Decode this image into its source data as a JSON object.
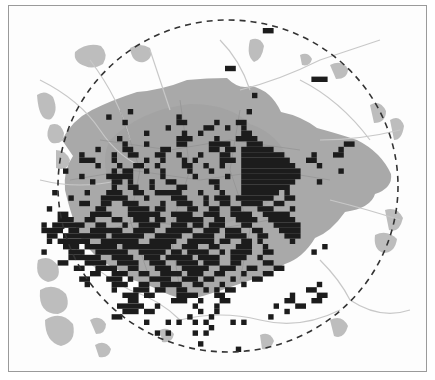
{
  "map": {
    "type": "grid-density-map",
    "colors": {
      "background": "#fdfdfd",
      "frame": "#9a9a9a",
      "urban_core": "#a9a9a9",
      "outer_patches": "#bdbdbd",
      "roads": "#c8c8c8",
      "boundaries": "#8f8f8f",
      "cells": "#1c1c1c",
      "circle": "#333333"
    },
    "circle": {
      "cx": 228,
      "cy": 186,
      "rx": 170,
      "ry": 166,
      "style": "dashed"
    },
    "grid": {
      "x0": 36,
      "y0": 28,
      "cell": 5.4
    },
    "cell_rows": [
      {
        "r": 0,
        "segs": [
          [
            42,
            43
          ]
        ]
      },
      {
        "r": 7,
        "segs": [
          [
            35,
            36
          ]
        ]
      },
      {
        "r": 9,
        "segs": [
          [
            51,
            53
          ]
        ]
      },
      {
        "r": 12,
        "segs": [
          [
            40,
            40
          ]
        ]
      },
      {
        "r": 15,
        "segs": [
          [
            17,
            17
          ],
          [
            39,
            39
          ]
        ]
      },
      {
        "r": 16,
        "segs": [
          [
            13,
            13
          ],
          [
            26,
            26
          ]
        ]
      },
      {
        "r": 17,
        "segs": [
          [
            16,
            16
          ],
          [
            26,
            27
          ],
          [
            33,
            33
          ],
          [
            37,
            38
          ]
        ]
      },
      {
        "r": 18,
        "segs": [
          [
            24,
            24
          ],
          [
            31,
            32
          ],
          [
            35,
            35
          ],
          [
            38,
            38
          ]
        ]
      },
      {
        "r": 19,
        "segs": [
          [
            20,
            20
          ],
          [
            27,
            27
          ],
          [
            30,
            30
          ],
          [
            38,
            39
          ]
        ]
      },
      {
        "r": 20,
        "segs": [
          [
            15,
            15
          ],
          [
            26,
            28
          ],
          [
            33,
            33
          ],
          [
            37,
            40
          ]
        ]
      },
      {
        "r": 21,
        "segs": [
          [
            16,
            16
          ],
          [
            20,
            20
          ],
          [
            26,
            27
          ],
          [
            32,
            35
          ],
          [
            39,
            41
          ],
          [
            57,
            58
          ]
        ]
      },
      {
        "r": 22,
        "segs": [
          [
            11,
            11
          ],
          [
            16,
            17
          ],
          [
            23,
            24
          ],
          [
            32,
            33
          ],
          [
            35,
            36
          ],
          [
            38,
            43
          ],
          [
            56,
            56
          ]
        ]
      },
      {
        "r": 23,
        "segs": [
          [
            8,
            8
          ],
          [
            14,
            14
          ],
          [
            17,
            18
          ],
          [
            22,
            23
          ],
          [
            26,
            26
          ],
          [
            30,
            30
          ],
          [
            34,
            35
          ],
          [
            38,
            45
          ],
          [
            51,
            51
          ],
          [
            55,
            56
          ]
        ]
      },
      {
        "r": 24,
        "segs": [
          [
            8,
            10
          ],
          [
            14,
            14
          ],
          [
            20,
            20
          ],
          [
            23,
            23
          ],
          [
            27,
            27
          ],
          [
            29,
            29
          ],
          [
            34,
            36
          ],
          [
            38,
            46
          ],
          [
            50,
            51
          ]
        ]
      },
      {
        "r": 25,
        "segs": [
          [
            11,
            11
          ],
          [
            15,
            15
          ],
          [
            18,
            19
          ],
          [
            22,
            22
          ],
          [
            27,
            28
          ],
          [
            31,
            31
          ],
          [
            34,
            34
          ],
          [
            38,
            47
          ],
          [
            52,
            52
          ]
        ]
      },
      {
        "r": 26,
        "segs": [
          [
            5,
            5
          ],
          [
            14,
            14
          ],
          [
            16,
            17
          ],
          [
            20,
            20
          ],
          [
            23,
            23
          ],
          [
            28,
            28
          ],
          [
            32,
            32
          ],
          [
            38,
            48
          ],
          [
            56,
            56
          ]
        ]
      },
      {
        "r": 27,
        "segs": [
          [
            8,
            8
          ],
          [
            13,
            17
          ],
          [
            23,
            23
          ],
          [
            29,
            29
          ],
          [
            35,
            35
          ],
          [
            38,
            48
          ]
        ]
      },
      {
        "r": 28,
        "segs": [
          [
            10,
            10
          ],
          [
            14,
            15
          ],
          [
            17,
            17
          ],
          [
            21,
            21
          ],
          [
            24,
            25
          ],
          [
            32,
            33
          ],
          [
            38,
            47
          ],
          [
            52,
            52
          ]
        ]
      },
      {
        "r": 29,
        "segs": [
          [
            14,
            14
          ],
          [
            17,
            18
          ],
          [
            21,
            21
          ],
          [
            26,
            27
          ],
          [
            33,
            33
          ],
          [
            38,
            46
          ]
        ]
      },
      {
        "r": 30,
        "segs": [
          [
            3,
            3
          ],
          [
            9,
            9
          ],
          [
            13,
            15
          ],
          [
            18,
            19
          ],
          [
            22,
            26
          ],
          [
            30,
            30
          ],
          [
            34,
            34
          ],
          [
            38,
            44
          ],
          [
            46,
            46
          ]
        ]
      },
      {
        "r": 31,
        "segs": [
          [
            6,
            6
          ],
          [
            12,
            16
          ],
          [
            20,
            20
          ],
          [
            25,
            27
          ],
          [
            31,
            31
          ],
          [
            33,
            35
          ],
          [
            37,
            43
          ],
          [
            46,
            47
          ]
        ]
      },
      {
        "r": 32,
        "segs": [
          [
            8,
            9
          ],
          [
            12,
            13
          ],
          [
            16,
            18
          ],
          [
            23,
            23
          ],
          [
            26,
            28
          ],
          [
            31,
            31
          ],
          [
            34,
            35
          ],
          [
            38,
            41
          ],
          [
            44,
            45
          ]
        ]
      },
      {
        "r": 33,
        "segs": [
          [
            2,
            2
          ],
          [
            11,
            12
          ],
          [
            17,
            20
          ],
          [
            22,
            23
          ],
          [
            28,
            29
          ],
          [
            32,
            33
          ],
          [
            36,
            37
          ],
          [
            41,
            43
          ],
          [
            47,
            47
          ]
        ]
      },
      {
        "r": 34,
        "segs": [
          [
            4,
            5
          ],
          [
            10,
            13
          ],
          [
            17,
            22
          ],
          [
            25,
            28
          ],
          [
            31,
            33
          ],
          [
            36,
            39
          ],
          [
            42,
            46
          ]
        ]
      },
      {
        "r": 35,
        "segs": [
          [
            4,
            6
          ],
          [
            9,
            10
          ],
          [
            14,
            15
          ],
          [
            18,
            20
          ],
          [
            22,
            23
          ],
          [
            26,
            30
          ],
          [
            33,
            34
          ],
          [
            37,
            40
          ],
          [
            43,
            47
          ]
        ]
      },
      {
        "r": 36,
        "segs": [
          [
            1,
            1
          ],
          [
            3,
            8
          ],
          [
            11,
            12
          ],
          [
            16,
            16
          ],
          [
            19,
            22
          ],
          [
            25,
            27
          ],
          [
            29,
            30
          ],
          [
            32,
            34
          ],
          [
            38,
            39
          ],
          [
            44,
            48
          ]
        ]
      },
      {
        "r": 37,
        "segs": [
          [
            1,
            4
          ],
          [
            6,
            7
          ],
          [
            10,
            15
          ],
          [
            18,
            21
          ],
          [
            24,
            28
          ],
          [
            31,
            33
          ],
          [
            35,
            37
          ],
          [
            40,
            41
          ],
          [
            45,
            48
          ]
        ]
      },
      {
        "r": 38,
        "segs": [
          [
            2,
            3
          ],
          [
            5,
            12
          ],
          [
            14,
            19
          ],
          [
            22,
            26
          ],
          [
            29,
            32
          ],
          [
            35,
            38
          ],
          [
            41,
            42
          ],
          [
            46,
            48
          ]
        ]
      },
      {
        "r": 39,
        "segs": [
          [
            2,
            2
          ],
          [
            4,
            9
          ],
          [
            12,
            18
          ],
          [
            21,
            25
          ],
          [
            28,
            32
          ],
          [
            34,
            35
          ],
          [
            38,
            39
          ],
          [
            41,
            41
          ],
          [
            47,
            47
          ]
        ]
      },
      {
        "r": 40,
        "segs": [
          [
            5,
            7
          ],
          [
            9,
            14
          ],
          [
            16,
            24
          ],
          [
            27,
            29
          ],
          [
            32,
            33
          ],
          [
            37,
            39
          ],
          [
            42,
            42
          ],
          [
            53,
            53
          ]
        ]
      },
      {
        "r": 41,
        "segs": [
          [
            1,
            1
          ],
          [
            6,
            8
          ],
          [
            11,
            16
          ],
          [
            19,
            23
          ],
          [
            25,
            26
          ],
          [
            28,
            31
          ],
          [
            34,
            34
          ],
          [
            36,
            39
          ],
          [
            42,
            43
          ],
          [
            51,
            51
          ]
        ]
      },
      {
        "r": 42,
        "segs": [
          [
            6,
            11
          ],
          [
            14,
            17
          ],
          [
            20,
            22
          ],
          [
            24,
            28
          ],
          [
            30,
            33
          ],
          [
            36,
            38
          ],
          [
            41,
            41
          ]
        ]
      },
      {
        "r": 43,
        "segs": [
          [
            4,
            5
          ],
          [
            9,
            12
          ],
          [
            15,
            18
          ],
          [
            21,
            23
          ],
          [
            26,
            29
          ],
          [
            31,
            33
          ],
          [
            36,
            37
          ],
          [
            42,
            43
          ]
        ]
      },
      {
        "r": 44,
        "segs": [
          [
            7,
            8
          ],
          [
            11,
            14
          ],
          [
            17,
            18
          ],
          [
            22,
            24
          ],
          [
            27,
            31
          ],
          [
            34,
            36
          ],
          [
            39,
            40
          ],
          [
            44,
            45
          ]
        ]
      },
      {
        "r": 45,
        "segs": [
          [
            10,
            11
          ],
          [
            14,
            16
          ],
          [
            19,
            20
          ],
          [
            23,
            26
          ],
          [
            28,
            30
          ],
          [
            33,
            34
          ],
          [
            38,
            38
          ],
          [
            42,
            43
          ]
        ]
      },
      {
        "r": 46,
        "segs": [
          [
            8,
            9
          ],
          [
            13,
            15
          ],
          [
            17,
            17
          ],
          [
            21,
            24
          ],
          [
            27,
            29
          ],
          [
            31,
            32
          ],
          [
            36,
            36
          ],
          [
            40,
            41
          ]
        ]
      },
      {
        "r": 47,
        "segs": [
          [
            9,
            9
          ],
          [
            14,
            16
          ],
          [
            19,
            20
          ],
          [
            23,
            26
          ],
          [
            29,
            30
          ],
          [
            34,
            34
          ],
          [
            38,
            38
          ],
          [
            52,
            52
          ]
        ]
      },
      {
        "r": 48,
        "segs": [
          [
            14,
            14
          ],
          [
            18,
            20
          ],
          [
            22,
            23
          ],
          [
            26,
            27
          ],
          [
            31,
            31
          ],
          [
            33,
            33
          ],
          [
            35,
            36
          ],
          [
            50,
            51
          ]
        ]
      },
      {
        "r": 49,
        "segs": [
          [
            16,
            18
          ],
          [
            20,
            21
          ],
          [
            26,
            29
          ],
          [
            33,
            34
          ],
          [
            47,
            47
          ],
          [
            52,
            53
          ]
        ]
      },
      {
        "r": 50,
        "segs": [
          [
            17,
            18
          ],
          [
            25,
            27
          ],
          [
            30,
            30
          ],
          [
            34,
            35
          ],
          [
            46,
            47
          ],
          [
            51,
            52
          ]
        ]
      },
      {
        "r": 51,
        "segs": [
          [
            15,
            19
          ],
          [
            22,
            22
          ],
          [
            29,
            29
          ],
          [
            33,
            33
          ],
          [
            44,
            44
          ],
          [
            48,
            49
          ]
        ]
      },
      {
        "r": 52,
        "segs": [
          [
            16,
            18
          ],
          [
            20,
            21
          ],
          [
            30,
            30
          ],
          [
            33,
            33
          ],
          [
            46,
            46
          ]
        ]
      },
      {
        "r": 53,
        "segs": [
          [
            14,
            15
          ],
          [
            28,
            28
          ],
          [
            32,
            32
          ],
          [
            43,
            43
          ]
        ]
      },
      {
        "r": 54,
        "segs": [
          [
            20,
            20
          ],
          [
            24,
            24
          ],
          [
            26,
            26
          ],
          [
            29,
            29
          ],
          [
            31,
            31
          ],
          [
            36,
            36
          ],
          [
            38,
            38
          ]
        ]
      },
      {
        "r": 55,
        "segs": [
          [
            32,
            32
          ]
        ]
      },
      {
        "r": 56,
        "segs": [
          [
            22,
            22
          ],
          [
            24,
            24
          ],
          [
            29,
            29
          ],
          [
            31,
            31
          ]
        ]
      },
      {
        "r": 58,
        "segs": [
          [
            30,
            30
          ]
        ]
      },
      {
        "r": 59,
        "segs": [
          [
            37,
            37
          ]
        ]
      }
    ]
  }
}
